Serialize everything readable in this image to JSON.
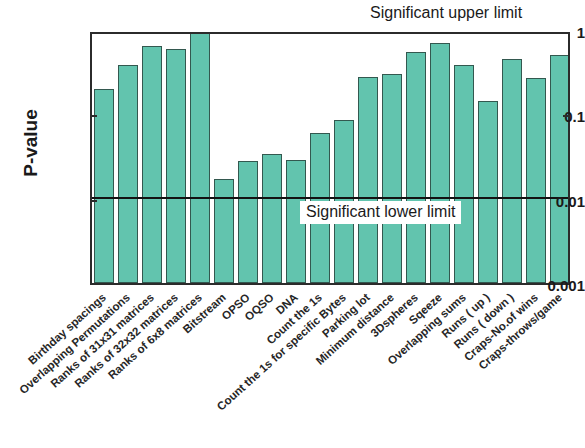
{
  "chart_data": {
    "type": "bar",
    "title": "",
    "xlabel": "",
    "ylabel": "P-value",
    "yscale": "log",
    "ylim": [
      0.001,
      1
    ],
    "yticks": [
      "0.001",
      "0.01",
      "0.1",
      "1"
    ],
    "ytick_values": [
      0.001,
      0.01,
      0.1,
      1
    ],
    "grid": false,
    "legend": "none",
    "bar_color": "#62c4ae",
    "bar_edge_color": "#33584f",
    "categories": [
      "Birthday spacings",
      "Overlapping Permutations",
      "Ranks of 31x31 matrices",
      "Ranks of 32x32 matrices",
      "Ranks of 6x8 matrices",
      "Bitstream",
      "OPSO",
      "OQSO",
      "DNA",
      "Count the 1s",
      "Count the 1s for specific Bytes",
      "Parking lot",
      "Minimum distance",
      "3Dspheres",
      "Sqeeze",
      "Overlapping sums",
      "Runs  ( up )",
      "Runs  ( down )",
      "Craps-No.of wins",
      "Craps-throws/game"
    ],
    "values": [
      0.2,
      0.39,
      0.65,
      0.59,
      0.98,
      0.017,
      0.028,
      0.034,
      0.029,
      0.06,
      0.085,
      0.28,
      0.3,
      0.55,
      0.7,
      0.38,
      0.145,
      0.45,
      0.27,
      0.5
    ],
    "annotations": [
      {
        "text": "Significant upper limit",
        "at_value": 1
      },
      {
        "text": "Significant lower limit",
        "at_value": 0.01
      }
    ],
    "threshold_line": {
      "value": 0.01,
      "color": "#121212"
    }
  },
  "axis": {
    "y_title": "P-value",
    "y_ticks": [
      "1",
      "0.1",
      "0.01",
      "0.001"
    ]
  },
  "annotations": {
    "upper": "Significant upper limit",
    "lower": "Significant lower limit"
  }
}
